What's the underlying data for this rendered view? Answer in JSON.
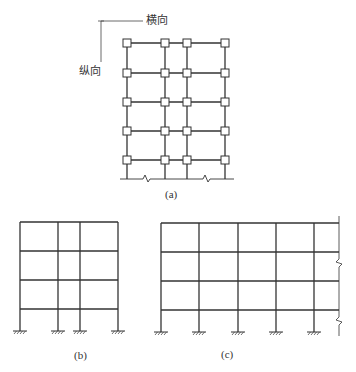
{
  "figure": {
    "plan_view": {
      "caption": "(a)",
      "axis_labels": {
        "horizontal": "横向",
        "vertical": "纵向"
      },
      "columns_x": [
        127,
        165,
        187,
        225
      ],
      "rows_y": [
        43,
        73,
        102,
        131,
        160
      ],
      "ground_y": 179
    },
    "frame_b": {
      "caption": "(b)",
      "columns_x": [
        20,
        58,
        80,
        118
      ],
      "beams_y": [
        222,
        251,
        280,
        309
      ],
      "support_y": 331
    },
    "frame_c": {
      "caption": "(c)",
      "columns_x": [
        161,
        199,
        238,
        276,
        314
      ],
      "beams_y": [
        223,
        252,
        281,
        310
      ],
      "support_y": 332,
      "break_line_x": 339
    },
    "colors": {
      "line": "#333333",
      "background": "#ffffff"
    }
  }
}
